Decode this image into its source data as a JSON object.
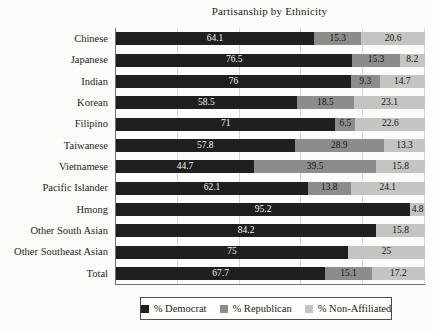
{
  "figure": {
    "background": "#fcfcfa",
    "axis_color": "#6f6f6d",
    "gridline_color": "#d6d6d3"
  },
  "chart_data": {
    "type": "bar",
    "orientation": "horizontal",
    "stacked": true,
    "title": "Partisanship by Ethnicity",
    "xlabel": "",
    "ylabel": "",
    "xlim": [
      0,
      100
    ],
    "grid": true,
    "gridlines_percent": [
      20,
      40,
      60,
      80,
      100
    ],
    "legend_position": "bottom",
    "categories": [
      "Chinese",
      "Japanese",
      "Indian",
      "Korean",
      "Filipino",
      "Taiwanese",
      "Vietnamese",
      "Pacific Islander",
      "Hmong",
      "Other South Asian",
      "Other Southeast Asian",
      "Total"
    ],
    "series": [
      {
        "name": "% Democrat",
        "color": "#1f1f1f",
        "label_color": "#f4f4f2",
        "values": [
          64.1,
          76.5,
          76,
          58.5,
          71,
          57.8,
          44.7,
          62.1,
          95.2,
          84.2,
          75,
          67.7
        ]
      },
      {
        "name": "% Republican",
        "color": "#8c8c8b",
        "label_color": "#161616",
        "values": [
          15.3,
          15.3,
          9.3,
          18.5,
          6.5,
          28.9,
          39.5,
          13.8,
          null,
          null,
          null,
          15.1
        ]
      },
      {
        "name": "% Non-Affiliated",
        "color": "#c4c4c2",
        "label_color": "#161616",
        "values": [
          20.6,
          8.2,
          14.7,
          23.1,
          22.6,
          13.3,
          15.8,
          24.1,
          4.8,
          15.8,
          25,
          17.2
        ]
      }
    ]
  }
}
